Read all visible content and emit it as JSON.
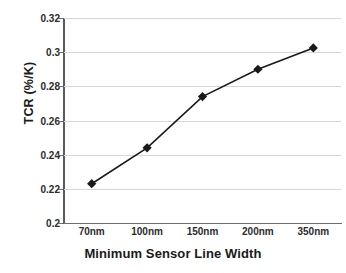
{
  "chart_data": {
    "type": "line",
    "title": "",
    "xlabel": "Minimum Sensor Line Width",
    "ylabel": "TCR (%/K)",
    "categories": [
      "70nm",
      "100nm",
      "150nm",
      "200nm",
      "350nm"
    ],
    "values": [
      0.223,
      0.244,
      0.274,
      0.29,
      0.3025
    ],
    "series": [
      {
        "name": "TCR",
        "values": [
          0.223,
          0.244,
          0.274,
          0.29,
          0.3025
        ]
      }
    ],
    "ylim": [
      0.2,
      0.32
    ],
    "ytick_labels": [
      "0.2",
      "0.22",
      "0.24",
      "0.26",
      "0.28",
      "0.3",
      "0.32"
    ],
    "ytick_values": [
      0.2,
      0.22,
      0.24,
      0.26,
      0.28,
      0.3,
      0.32
    ],
    "grid": true,
    "grid_axis": "y",
    "legend": false,
    "legend_position": "none",
    "marker": "diamond",
    "marker_color": "#1a1a1a",
    "line_color": "#1a1a1a",
    "gridline_color": "#d7d7d7",
    "axis_color": "#6e6e6e",
    "background": "#ffffff"
  }
}
